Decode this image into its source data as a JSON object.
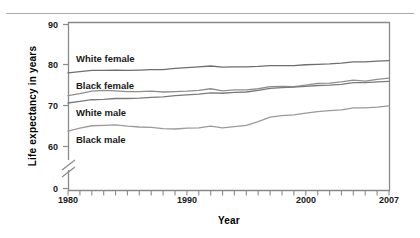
{
  "chart_data": {
    "type": "line",
    "title": "",
    "xlabel": "Year",
    "ylabel": "Life expectancy in years",
    "xlim": [
      1980,
      2007
    ],
    "ylim": [
      55,
      90
    ],
    "grid": false,
    "legend_position": "inline-labels",
    "axis_break": true,
    "axis_break_note": "y-axis broken between 0 and 55",
    "ytick_labels": [
      "90",
      "80",
      "70",
      "60",
      "0"
    ],
    "ytick_values": [
      90,
      80,
      70,
      60,
      0
    ],
    "xtick_labels": [
      "1980",
      "1990",
      "2000",
      "2007"
    ],
    "xtick_values": [
      1980,
      1990,
      2000,
      2007
    ],
    "x": [
      1980,
      1981,
      1982,
      1983,
      1984,
      1985,
      1986,
      1987,
      1988,
      1989,
      1990,
      1991,
      1992,
      1993,
      1994,
      1995,
      1996,
      1997,
      1998,
      1999,
      2000,
      2001,
      2002,
      2003,
      2004,
      2005,
      2006,
      2007
    ],
    "series": [
      {
        "name": "White female",
        "color": "#6e6e6e",
        "values": [
          78.1,
          78.4,
          78.7,
          78.7,
          78.8,
          78.7,
          78.8,
          78.9,
          78.9,
          79.2,
          79.4,
          79.6,
          79.8,
          79.5,
          79.6,
          79.6,
          79.7,
          79.9,
          79.9,
          79.9,
          80.1,
          80.2,
          80.3,
          80.5,
          80.8,
          80.8,
          81.0,
          81.1
        ]
      },
      {
        "name": "Black female",
        "color": "#8f8f8f",
        "values": [
          72.5,
          73.0,
          73.6,
          73.8,
          73.7,
          73.5,
          73.5,
          73.6,
          73.4,
          73.5,
          73.6,
          73.8,
          74.2,
          73.7,
          73.9,
          73.9,
          74.2,
          74.7,
          74.8,
          74.7,
          75.1,
          75.5,
          75.6,
          75.9,
          76.3,
          76.1,
          76.5,
          76.8
        ]
      },
      {
        "name": "White male",
        "color": "#7a7a7a",
        "values": [
          70.7,
          71.1,
          71.5,
          71.6,
          71.8,
          71.8,
          71.9,
          72.1,
          72.2,
          72.5,
          72.7,
          72.9,
          73.2,
          73.1,
          73.3,
          73.4,
          73.8,
          74.3,
          74.5,
          74.6,
          74.8,
          75.0,
          75.1,
          75.3,
          75.7,
          75.7,
          75.9,
          76.0
        ]
      },
      {
        "name": "Black male",
        "color": "#9a9a9a",
        "values": [
          63.8,
          64.5,
          65.1,
          65.2,
          65.3,
          65.0,
          64.8,
          64.7,
          64.4,
          64.3,
          64.5,
          64.6,
          65.0,
          64.6,
          64.9,
          65.2,
          66.1,
          67.2,
          67.6,
          67.8,
          68.2,
          68.6,
          68.8,
          69.0,
          69.5,
          69.5,
          69.7,
          70.0
        ]
      }
    ]
  },
  "labels": {
    "ylabel": "Life expectancy in years",
    "xlabel": "Year",
    "y_tick_90": "90",
    "y_tick_80": "80",
    "y_tick_70": "70",
    "y_tick_60": "60",
    "y_tick_0": "0",
    "x_tick_1980": "1980",
    "x_tick_1990": "1990",
    "x_tick_2000": "2000",
    "x_tick_2007": "2007",
    "series_white_female": "White female",
    "series_black_female": "Black female",
    "series_white_male": "White male",
    "series_black_male": "Black male"
  }
}
